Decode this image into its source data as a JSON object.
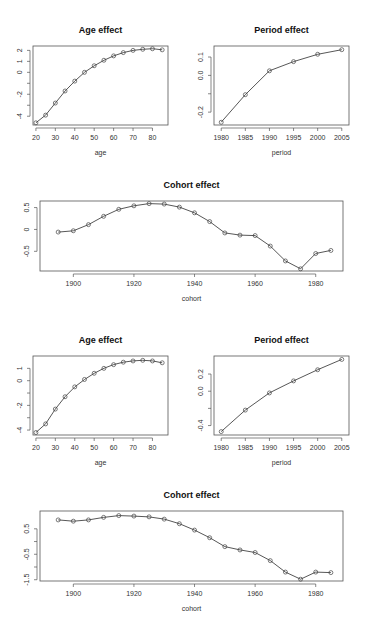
{
  "chart_data": [
    {
      "id": "age1",
      "type": "line",
      "title": "Age effect",
      "xlabel": "age",
      "ylabel": "",
      "x": [
        20,
        25,
        30,
        35,
        40,
        45,
        50,
        55,
        60,
        65,
        70,
        75,
        80,
        85
      ],
      "values": [
        -4.6,
        -3.9,
        -2.8,
        -1.7,
        -0.8,
        0.0,
        0.6,
        1.1,
        1.5,
        1.8,
        2.0,
        2.1,
        2.15,
        2.05
      ],
      "xticks": [
        20,
        30,
        40,
        50,
        60,
        70,
        80
      ],
      "yticks": [
        -4,
        -3,
        -2,
        -1,
        0,
        1,
        2
      ],
      "yticklabels": [
        "-4",
        "",
        "-2",
        "",
        "0",
        "1",
        "2"
      ],
      "xlim": [
        18.5,
        88
      ],
      "ylim": [
        -4.8,
        2.4
      ],
      "grid": false,
      "markers": "open-circle",
      "box": {
        "x": 33,
        "y": 46,
        "w": 135,
        "h": 79
      }
    },
    {
      "id": "period1",
      "type": "line",
      "title": "Period effect",
      "xlabel": "period",
      "ylabel": "",
      "x": [
        1980,
        1985,
        1990,
        1995,
        2000,
        2005
      ],
      "values": [
        -0.255,
        -0.105,
        0.025,
        0.075,
        0.115,
        0.14
      ],
      "xticks": [
        1980,
        1985,
        1990,
        1995,
        2000,
        2005
      ],
      "yticks": [
        -0.2,
        -0.1,
        0.0,
        0.1
      ],
      "yticklabels": [
        "-0.2",
        "",
        "0.0",
        "0.1"
      ],
      "xlim": [
        1978.5,
        2006.5
      ],
      "ylim": [
        -0.27,
        0.16
      ],
      "grid": false,
      "markers": "open-circle",
      "box": {
        "x": 214,
        "y": 46,
        "w": 135,
        "h": 79
      }
    },
    {
      "id": "cohort1",
      "type": "line",
      "title": "Cohort effect",
      "xlabel": "cohort",
      "ylabel": "",
      "x": [
        1895,
        1900,
        1905,
        1910,
        1915,
        1920,
        1925,
        1930,
        1935,
        1940,
        1945,
        1950,
        1955,
        1960,
        1965,
        1970,
        1975,
        1980,
        1985
      ],
      "values": [
        -0.06,
        -0.03,
        0.11,
        0.3,
        0.46,
        0.54,
        0.59,
        0.58,
        0.51,
        0.38,
        0.18,
        -0.08,
        -0.13,
        -0.14,
        -0.38,
        -0.72,
        -0.9,
        -0.55,
        -0.48
      ],
      "xticks": [
        1900,
        1920,
        1940,
        1960,
        1980
      ],
      "yticks": [
        -0.5,
        0.0,
        0.5
      ],
      "xlim": [
        1889,
        1989
      ],
      "ylim": [
        -0.95,
        0.65
      ],
      "grid": false,
      "markers": "open-circle",
      "box": {
        "x": 40,
        "y": 201,
        "w": 303,
        "h": 70
      }
    },
    {
      "id": "age2",
      "type": "line",
      "title": "Age effect",
      "xlabel": "age",
      "ylabel": "",
      "x": [
        20,
        25,
        30,
        35,
        40,
        45,
        50,
        55,
        60,
        65,
        70,
        75,
        80,
        85
      ],
      "values": [
        -4.2,
        -3.5,
        -2.3,
        -1.3,
        -0.5,
        0.1,
        0.6,
        1.0,
        1.3,
        1.5,
        1.6,
        1.65,
        1.6,
        1.45
      ],
      "xticks": [
        20,
        30,
        40,
        50,
        60,
        70,
        80
      ],
      "yticks": [
        -4,
        -3,
        -2,
        -1,
        0,
        1
      ],
      "yticklabels": [
        "-4",
        "",
        "-2",
        "",
        "0",
        "1"
      ],
      "xlim": [
        18.5,
        88
      ],
      "ylim": [
        -4.4,
        2.0
      ],
      "grid": false,
      "markers": "open-circle",
      "box": {
        "x": 33,
        "y": 356,
        "w": 135,
        "h": 79
      }
    },
    {
      "id": "period2",
      "type": "line",
      "title": "Period effect",
      "xlabel": "period",
      "ylabel": "",
      "x": [
        1980,
        1985,
        1990,
        1995,
        2000,
        2005
      ],
      "values": [
        -0.47,
        -0.22,
        -0.02,
        0.12,
        0.25,
        0.37
      ],
      "xticks": [
        1980,
        1985,
        1990,
        1995,
        2000,
        2005
      ],
      "yticks": [
        -0.4,
        -0.2,
        0.0,
        0.2
      ],
      "yticklabels": [
        "-0.4",
        "",
        "0.0",
        "0.2"
      ],
      "xlim": [
        1978.5,
        2006.5
      ],
      "ylim": [
        -0.51,
        0.41
      ],
      "grid": false,
      "markers": "open-circle",
      "box": {
        "x": 214,
        "y": 356,
        "w": 135,
        "h": 79
      }
    },
    {
      "id": "cohort2",
      "type": "line",
      "title": "Cohort effect",
      "xlabel": "cohort",
      "ylabel": "",
      "x": [
        1895,
        1900,
        1905,
        1910,
        1915,
        1920,
        1925,
        1930,
        1935,
        1940,
        1945,
        1950,
        1955,
        1960,
        1965,
        1970,
        1975,
        1980,
        1985
      ],
      "values": [
        0.85,
        0.8,
        0.85,
        0.95,
        1.02,
        1.0,
        0.97,
        0.88,
        0.7,
        0.45,
        0.15,
        -0.2,
        -0.33,
        -0.43,
        -0.75,
        -1.2,
        -1.48,
        -1.2,
        -1.22
      ],
      "xticks": [
        1900,
        1920,
        1940,
        1960,
        1980
      ],
      "yticks": [
        -1.5,
        -1.0,
        -0.5,
        0.0,
        0.5
      ],
      "yticklabels": [
        "-1.5",
        "",
        "-0.5",
        "",
        "0.5"
      ],
      "xlim": [
        1889,
        1989
      ],
      "ylim": [
        -1.55,
        1.2
      ],
      "grid": false,
      "markers": "open-circle",
      "box": {
        "x": 40,
        "y": 511,
        "w": 303,
        "h": 70
      }
    }
  ]
}
